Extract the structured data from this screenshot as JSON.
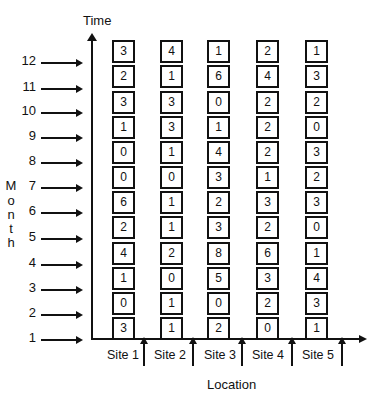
{
  "diagram": {
    "y_axis_title": "Time",
    "y_axis_side_label": [
      "M",
      "o",
      "n",
      "t",
      "h"
    ],
    "x_axis_title": "Location",
    "months": [
      "12",
      "11",
      "10",
      "9",
      "8",
      "7",
      "6",
      "5",
      "4",
      "3",
      "2",
      "1"
    ],
    "sites": [
      "Site 1",
      "Site 2",
      "Site 3",
      "Site 4",
      "Site 5"
    ],
    "grid_note": "values listed per site from top (month 12) to bottom (month 1)",
    "values": {
      "site1": [
        "3",
        "2",
        "3",
        "1",
        "0",
        "0",
        "6",
        "2",
        "4",
        "1",
        "0",
        "3"
      ],
      "site2": [
        "4",
        "1",
        "3",
        "3",
        "1",
        "0",
        "1",
        "1",
        "2",
        "0",
        "1",
        "1"
      ],
      "site3": [
        "1",
        "6",
        "0",
        "1",
        "4",
        "3",
        "2",
        "3",
        "8",
        "5",
        "0",
        "2"
      ],
      "site4": [
        "2",
        "4",
        "2",
        "2",
        "2",
        "1",
        "3",
        "2",
        "6",
        "3",
        "2",
        "0"
      ],
      "site5": [
        "1",
        "3",
        "2",
        "0",
        "3",
        "2",
        "3",
        "0",
        "1",
        "4",
        "3",
        "1"
      ]
    }
  }
}
